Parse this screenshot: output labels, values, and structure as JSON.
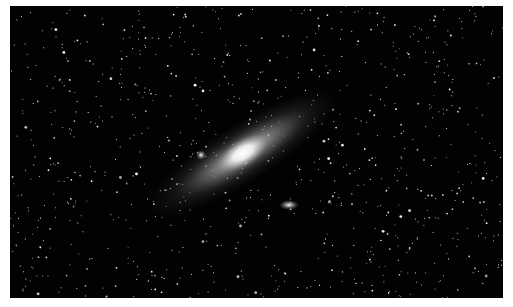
{
  "image": {
    "subject": "Andromeda galaxy in starfield",
    "background_color": "#020202",
    "border_color": "#ffffff",
    "galaxy": {
      "cx": 233,
      "cy": 147,
      "rx": 110,
      "ry": 26,
      "rotation": -32
    },
    "companions": [
      {
        "name": "satellite-galaxy-1",
        "cx": 191,
        "cy": 149,
        "r": 4
      },
      {
        "name": "satellite-galaxy-2",
        "cx": 279,
        "cy": 199,
        "rx": 9,
        "ry": 4
      }
    ],
    "star_count": 900
  }
}
